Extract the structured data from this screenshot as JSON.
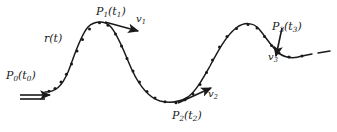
{
  "figure": {
    "kind": "hand-drawn-diagram",
    "background_color": "#ffffff",
    "ink_color": "#1a1a1a",
    "labels": {
      "curve_function": {
        "base": "r",
        "arg": "(t)"
      },
      "point0": {
        "base": "P",
        "sub": "0",
        "arg": "(t",
        "arg_sub": "0",
        "arg_end": ")"
      },
      "point1": {
        "base": "P",
        "sub": "1",
        "arg": "(t",
        "arg_sub": "1",
        "arg_end": ")"
      },
      "point2": {
        "base": "P",
        "sub": "2",
        "arg": "(t",
        "arg_sub": "2",
        "arg_end": ")"
      },
      "point3": {
        "base": "P",
        "sub": "3",
        "arg": "(t",
        "arg_sub": "3",
        "arg_end": ")"
      },
      "velocity1": {
        "base": "v",
        "sub": "1"
      },
      "velocity2": {
        "base": "v",
        "sub": "2"
      },
      "velocity3": {
        "base": "v",
        "sub": "3"
      }
    },
    "geometry": {
      "curve_path": "M 45 92 C 56 92, 62 86, 68 72 C 74 57, 80 36, 88 27 C 94 21, 104 20, 110 26 C 118 34, 124 52, 132 70 C 140 87, 150 98, 160 101 C 172 104, 180 102, 188 97 C 196 91, 202 80, 210 66 C 218 51, 226 36, 236 28 C 244 22, 253 22, 259 29 C 266 37, 272 48, 280 54 C 288 59, 296 58, 302 56",
      "dash_tail_path": "M 302 56 L 312 54 M 318 53 L 330 51",
      "sample_points": [
        [
          49,
          91.3
        ],
        [
          55,
          88.4
        ],
        [
          61,
          82.1
        ],
        [
          66.4,
          74.3
        ],
        [
          71.5,
          64.0
        ],
        [
          77.0,
          51.0
        ],
        [
          82.5,
          39.5
        ],
        [
          89.5,
          29.0
        ],
        [
          99.5,
          22.8
        ],
        [
          108.0,
          25.2
        ],
        [
          115.5,
          34.0
        ],
        [
          121.5,
          46.0
        ],
        [
          127.0,
          58.5
        ],
        [
          133.0,
          71.0
        ],
        [
          139.5,
          82.0
        ],
        [
          147.0,
          91.5
        ],
        [
          155.0,
          98.0
        ],
        [
          165.0,
          101.8
        ],
        [
          176.0,
          102.8
        ],
        [
          185.0,
          99.8
        ],
        [
          193.0,
          94.0
        ],
        [
          200.0,
          84.5
        ],
        [
          206.5,
          72.5
        ],
        [
          212.5,
          60.0
        ],
        [
          219.5,
          47.0
        ],
        [
          227.0,
          36.5
        ],
        [
          236.5,
          28.5
        ],
        [
          248.0,
          24.5
        ],
        [
          257.0,
          28.0
        ],
        [
          264.5,
          36.5
        ],
        [
          271.5,
          45.5
        ],
        [
          279.0,
          53.0
        ],
        [
          289.0,
          57.0
        ],
        [
          302.0,
          56.0
        ]
      ],
      "arrow_v0": {
        "x1": 20,
        "y1": 95,
        "x2": 50,
        "y2": 95
      },
      "arrow_v0_base": {
        "x1": 20,
        "y1": 99,
        "x2": 45,
        "y2": 99
      },
      "arrow_v1": {
        "x1": 105,
        "y1": 22,
        "x2": 138,
        "y2": 31
      },
      "arrow_v2": {
        "x1": 178,
        "y1": 103,
        "x2": 211,
        "y2": 88
      },
      "arrow_v3": {
        "x1": 282,
        "y1": 28,
        "x2": 276,
        "y2": 56
      }
    }
  }
}
